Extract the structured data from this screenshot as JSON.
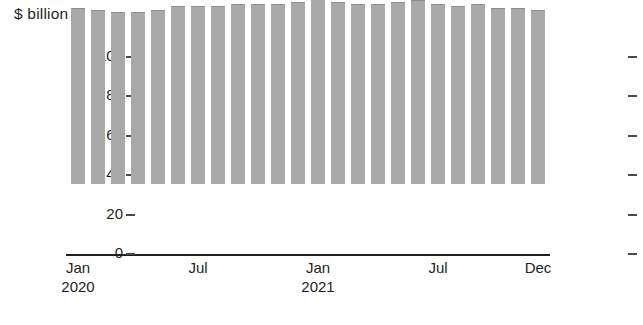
{
  "chart_data": {
    "type": "bar",
    "stacked": true,
    "title": "$ billion",
    "xlabel": "",
    "ylabel": "$ billion",
    "ylim": [
      0,
      100
    ],
    "ytick_values": [
      100,
      80,
      60,
      40,
      20,
      0
    ],
    "ytick_labels": [
      "100",
      "80",
      "60",
      "40",
      "20",
      "0"
    ],
    "grid": false,
    "legend": false,
    "axis_ticks_both_sides": true,
    "bar_color": "#a9a9a9",
    "segment_divider_color": "#5c5c5c",
    "axis_color": "#231f20",
    "categories": [
      "Jan 2020",
      "Feb 2020",
      "Mar 2020",
      "Apr 2020",
      "May 2020",
      "Jun 2020",
      "Jul 2020",
      "Aug 2020",
      "Sep 2020",
      "Oct 2020",
      "Nov 2020",
      "Dec 2020",
      "Jan 2021",
      "Feb 2021",
      "Mar 2021",
      "Apr 2021",
      "May 2021",
      "Jun 2021",
      "Jul 2021",
      "Aug 2021",
      "Sep 2021",
      "Oct 2021",
      "Nov 2021",
      "Dec 2021"
    ],
    "x_tick_labels": [
      {
        "month": "Jan",
        "year": "2020",
        "index": 0
      },
      {
        "month": "Jul",
        "year": "",
        "index": 6
      },
      {
        "month": "Jan",
        "year": "2021",
        "index": 12
      },
      {
        "month": "Jul",
        "year": "",
        "index": 18
      },
      {
        "month": "Dec",
        "year": "",
        "index": 23
      }
    ],
    "series": [
      {
        "name": "lower-segment",
        "values": [
          59,
          58,
          57,
          56,
          56,
          57,
          57,
          56,
          56,
          56,
          56,
          56,
          56,
          56,
          56,
          56,
          56,
          56,
          55,
          55,
          55,
          54,
          54,
          54
        ]
      },
      {
        "name": "upper-segment",
        "values": [
          30,
          30,
          30,
          31,
          32,
          33,
          33,
          34,
          35,
          35,
          35,
          36,
          38,
          36,
          35,
          35,
          36,
          37,
          36,
          35,
          36,
          35,
          35,
          34
        ]
      }
    ],
    "totals": [
      89,
      88,
      87,
      87,
      88,
      90,
      90,
      90,
      91,
      91,
      91,
      92,
      94,
      92,
      91,
      91,
      92,
      93,
      91,
      90,
      91,
      89,
      89,
      88
    ]
  }
}
